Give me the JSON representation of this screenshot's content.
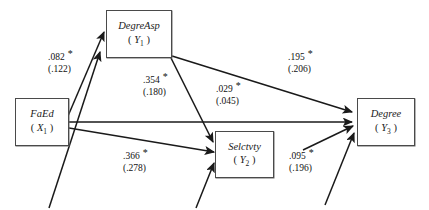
{
  "diagram": {
    "background": "#ffffff",
    "line_color": "#1a1a1a"
  },
  "nodes": [
    {
      "id": "faed",
      "label": "FaEd",
      "symbol_open": "( ",
      "symbol_letter": "X",
      "symbol_index": "1",
      "symbol_close": " )"
    },
    {
      "id": "degreasp",
      "label": "DegreAsp",
      "symbol_open": "( ",
      "symbol_letter": "Y",
      "symbol_index": "1",
      "symbol_close": " )"
    },
    {
      "id": "selctvty",
      "label": "Selctvty",
      "symbol_open": "( ",
      "symbol_letter": "Y",
      "symbol_index": "2",
      "symbol_close": " )"
    },
    {
      "id": "degree",
      "label": "Degree",
      "symbol_open": "( ",
      "symbol_letter": "Y",
      "symbol_index": "3",
      "symbol_close": " )"
    }
  ],
  "coefficients": [
    {
      "id": "faed-to-degreasp",
      "estimate": ".082",
      "significance": "*",
      "standard_error": "(.122)"
    },
    {
      "id": "degreasp-to-selctvty",
      "estimate": ".354",
      "significance": "*",
      "standard_error": "(.180)"
    },
    {
      "id": "faed-to-degree",
      "estimate": ".029",
      "significance": "*",
      "standard_error": "(.045)"
    },
    {
      "id": "degreasp-to-degree",
      "estimate": ".195",
      "significance": "*",
      "standard_error": "(.206)"
    },
    {
      "id": "faed-to-selctvty",
      "estimate": ".366",
      "significance": "*",
      "standard_error": "(.278)"
    },
    {
      "id": "selctvty-to-degree",
      "estimate": ".095",
      "significance": "*",
      "standard_error": "(.196)"
    }
  ]
}
